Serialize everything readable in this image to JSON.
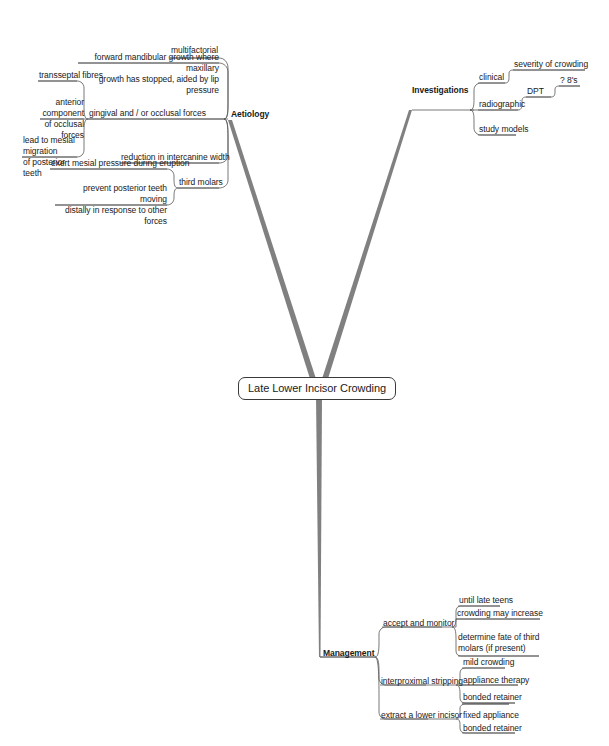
{
  "title": "Late Lower Incisor Crowding",
  "colors": {
    "background": "#ffffff",
    "branch": "#808080",
    "connector": "#555555",
    "text": "#1a1a1a",
    "center_border": "#3a3a3a"
  },
  "center": {
    "label": "Late Lower Incisor Crowding"
  },
  "branches": [
    {
      "id": "aetiology",
      "label": "Aetiology",
      "children": [
        {
          "label": "multifactorial"
        },
        {
          "label": "forward mandibular growth where maxillary growth has stopped, aided by lip pressure"
        },
        {
          "label": "gingival and / or occlusal forces",
          "children": [
            {
              "label": "transseptal fibres"
            },
            {
              "label": "anterior component of occlusal forces"
            },
            {
              "label": "lead to mesial migration of posterior teeth"
            }
          ]
        },
        {
          "label": "reduction in intercanine width"
        },
        {
          "label": "third molars",
          "children": [
            {
              "label": "exert mesial pressure during eruption"
            },
            {
              "label": "prevent posterior teeth moving distally in response to other forces"
            }
          ]
        }
      ]
    },
    {
      "id": "investigations",
      "label": "Investigations",
      "children": [
        {
          "label": "clinical",
          "children": [
            {
              "label": "severity of crowding"
            }
          ]
        },
        {
          "label": "radiographic",
          "children": [
            {
              "label": "DPT",
              "children": [
                {
                  "label": "? 8's"
                }
              ]
            }
          ]
        },
        {
          "label": "study models"
        }
      ]
    },
    {
      "id": "management",
      "label": "Management",
      "children": [
        {
          "label": "accept and monitor",
          "children": [
            {
              "label": "until late teens"
            },
            {
              "label": "crowding may increase"
            },
            {
              "label": "determine fate of third molars (if present)"
            }
          ]
        },
        {
          "label": "interproximal stripping",
          "children": [
            {
              "label": "mild crowding"
            },
            {
              "label": "appliance therapy"
            },
            {
              "label": "bonded retainer"
            }
          ]
        },
        {
          "label": "extract a lower incisor",
          "children": [
            {
              "label": "fixed appliance"
            },
            {
              "label": "bonded retainer"
            }
          ]
        }
      ]
    }
  ],
  "nodes": {
    "multifactorial": "multifactorial",
    "forward_growth_l1": "forward mandibular growth where maxillary",
    "forward_growth_l2": "growth has stopped, aided by lip pressure",
    "transseptal": "transseptal fibres",
    "anterior_comp_l1": "anterior component",
    "anterior_comp_l2": "of occlusal forces",
    "mesial_migration_l1": "lead to mesial migration",
    "mesial_migration_l2": "of posterior teeth",
    "gingival_occlusal": "gingival and / or occlusal forces",
    "aetiology": "Aetiology",
    "intercanine": "reduction in intercanine width",
    "exert_mesial": "exert mesial pressure during eruption",
    "prevent_post_l1": "prevent posterior teeth moving",
    "prevent_post_l2": "distally in response to other forces",
    "third_molars": "third molars",
    "investigations": "Investigations",
    "clinical": "clinical",
    "severity": "severity of crowding",
    "radiographic": "radiographic",
    "dpt": "DPT",
    "eights": "? 8's",
    "study_models": "study models",
    "management": "Management",
    "accept_monitor": "accept and monitor",
    "until_late_teens": "until late teens",
    "crowding_increase": "crowding may increase",
    "determine_fate_l1": "determine fate of third",
    "determine_fate_l2": "molars (if present)",
    "interproximal": "interproximal stripping",
    "mild_crowding": "mild crowding",
    "appliance_therapy": "appliance therapy",
    "bonded_retainer_1": "bonded retainer",
    "extract_incisor": "extract a lower incisor",
    "fixed_appliance": "fixed appliance",
    "bonded_retainer_2": "bonded retainer"
  }
}
